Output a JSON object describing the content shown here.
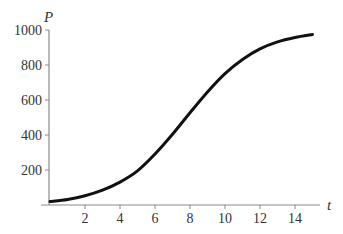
{
  "chart_data": {
    "type": "line",
    "title": "",
    "xlabel": "t",
    "ylabel": "P",
    "xlim": [
      0,
      15.5
    ],
    "ylim": [
      0,
      1000
    ],
    "x_ticks": [
      2,
      4,
      6,
      8,
      10,
      12,
      14
    ],
    "y_ticks": [
      200,
      400,
      600,
      800,
      1000
    ],
    "grid": false,
    "legend": null,
    "series": [
      {
        "name": "P(t)",
        "description": "logistic growth curve",
        "color": "#111111",
        "x": [
          0,
          1,
          2,
          3,
          4,
          5,
          6,
          7,
          8,
          9,
          10,
          11,
          12,
          13,
          14,
          15
        ],
        "values": [
          20,
          32,
          53,
          85,
          131,
          195,
          291,
          404,
          527,
          646,
          751,
          832,
          892,
          932,
          957,
          974
        ]
      }
    ]
  },
  "labels": {
    "x_axis": "t",
    "y_axis": "P"
  },
  "colors": {
    "axis": "#8a8a8a",
    "curve": "#111111",
    "text": "#333333"
  }
}
